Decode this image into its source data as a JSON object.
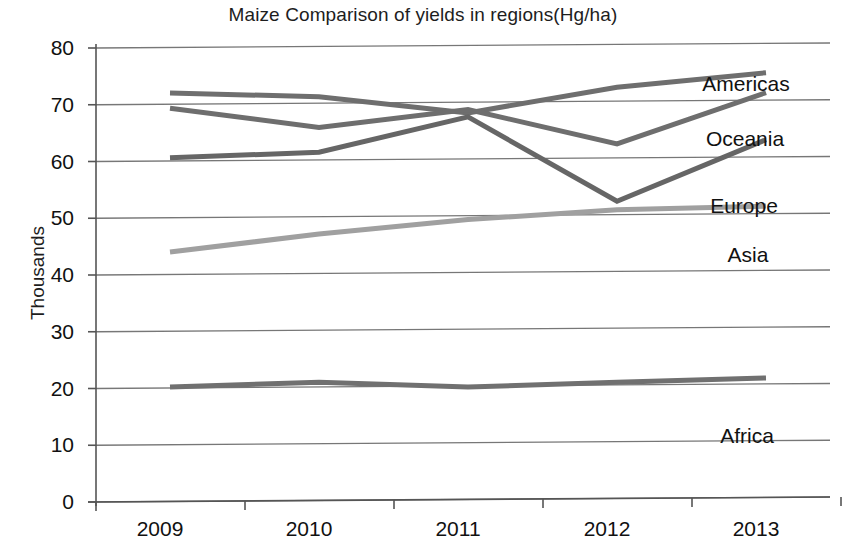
{
  "chart_data": {
    "type": "line",
    "title": "Maize Comparison of yields in regions(Hg/ha)",
    "xlabel": "",
    "ylabel": "Thousands",
    "categories": [
      "2009",
      "2010",
      "2011",
      "2012",
      "2013"
    ],
    "ylim": [
      0,
      80
    ],
    "yticks": [
      0,
      10,
      20,
      30,
      40,
      50,
      60,
      70,
      80
    ],
    "grid": "horizontal",
    "legend_position": "right-inline-labels",
    "series": [
      {
        "name": "Americas",
        "color": "#6e6e6e",
        "values": [
          72.0,
          71.2,
          68.2,
          72.6,
          75.0
        ]
      },
      {
        "name": "Oceania",
        "color": "#6e6e6e",
        "values": [
          69.3,
          65.8,
          68.8,
          62.6,
          71.5
        ]
      },
      {
        "name": "Europe",
        "color": "#666666",
        "values": [
          60.6,
          61.4,
          67.5,
          52.5,
          63.2
        ]
      },
      {
        "name": "Asia",
        "color": "#a0a0a0",
        "values": [
          44.0,
          47.0,
          49.4,
          51.0,
          51.5
        ]
      },
      {
        "name": "Africa",
        "color": "#707070",
        "values": [
          20.2,
          20.9,
          19.9,
          20.6,
          21.2
        ]
      }
    ],
    "annotations": [
      {
        "text": "Americas",
        "x": 746,
        "y": 73
      },
      {
        "text": "Oceania",
        "x": 745,
        "y": 128
      },
      {
        "text": "Europe",
        "x": 744,
        "y": 195
      },
      {
        "text": "Asia",
        "x": 748,
        "y": 244
      },
      {
        "text": "Africa",
        "x": 747,
        "y": 425
      }
    ]
  },
  "axis": {
    "y_tick_labels": [
      "80",
      "70",
      "60",
      "50",
      "40",
      "30",
      "20",
      "10",
      "0"
    ],
    "x_tick_labels": [
      "2009",
      "2010",
      "2011",
      "2012",
      "2013"
    ]
  },
  "colors": {
    "axis": "#555555",
    "gridline": "#777777",
    "text": "#111111",
    "background": "#ffffff"
  }
}
